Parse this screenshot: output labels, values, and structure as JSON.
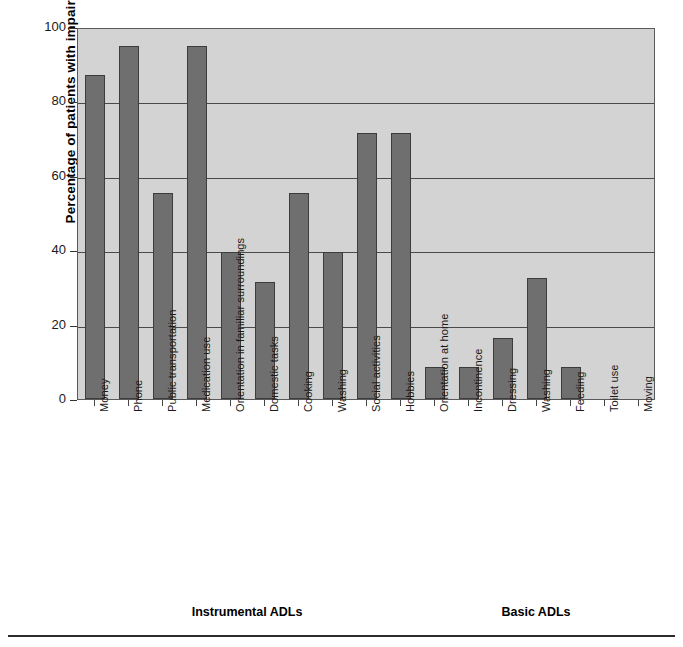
{
  "chart_data": {
    "type": "bar",
    "title": "",
    "xlabel": "",
    "ylabel": "Percentage of patients with impairment",
    "ylim": [
      0,
      100
    ],
    "yticks": [
      0,
      20,
      40,
      60,
      80,
      100
    ],
    "grid": true,
    "legend": false,
    "categories": [
      "Money",
      "Phone",
      "Public transportation",
      "Medication use",
      "Orientation in familiar surroundings",
      "Domestic tasks",
      "Cooking",
      "Washing",
      "Social activities",
      "Hobbies",
      "Orientation at home",
      "Incontinence",
      "Dressing",
      "Washing",
      "Feeding",
      "Toilet use",
      "Moving"
    ],
    "values": [
      87,
      95,
      55.5,
      95,
      39.5,
      31.5,
      55.5,
      39.5,
      71.5,
      71.5,
      8.5,
      8.5,
      16.3,
      32.6,
      8.5,
      0,
      0
    ],
    "groups": [
      {
        "label": "Instrumental ADLs",
        "start_index": 0,
        "end_index": 9
      },
      {
        "label": "Basic ADLs",
        "start_index": 10,
        "end_index": 16
      }
    ],
    "colors": {
      "bar": "#6f6f6f",
      "bar_edge": "#3c3c3c",
      "plot_background": "#d3d3d3",
      "gridline": "#4a4a4a",
      "axis": "#333333",
      "text": "#1a1a1a"
    }
  }
}
